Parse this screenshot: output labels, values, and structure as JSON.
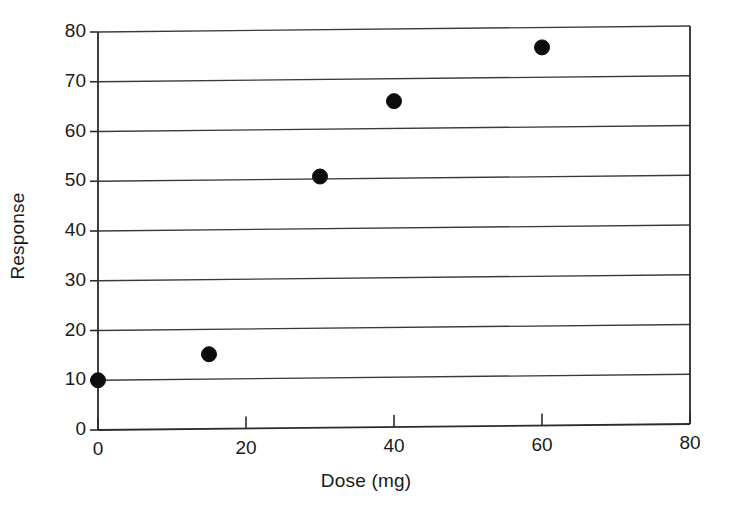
{
  "chart_data": {
    "type": "scatter",
    "title": "",
    "subtitle": "",
    "xlabel": "Dose (mg)",
    "ylabel": "Response",
    "xlim": [
      0,
      80
    ],
    "ylim": [
      0,
      80
    ],
    "xticks": [
      0,
      20,
      40,
      60,
      80
    ],
    "yticks": [
      0,
      10,
      20,
      30,
      40,
      50,
      60,
      70,
      80
    ],
    "xtick_labels": [
      "0",
      "20",
      "40",
      "60",
      "80"
    ],
    "ytick_labels": [
      "0",
      "10",
      "20",
      "30",
      "40",
      "50",
      "60",
      "70",
      "80"
    ],
    "grid": {
      "horizontal": true,
      "vertical": false,
      "interval": 10,
      "color": "#3a3a3a"
    },
    "legend": {
      "visible": false,
      "position": "none",
      "entries": []
    },
    "annotations": [],
    "marker": {
      "shape": "circle",
      "filled": true,
      "color": "#0d0d0d",
      "edge_color": "#0d0d0d",
      "size_px": 15
    },
    "series": [
      {
        "name": "Response vs Dose",
        "color": "#0d0d0d",
        "points": [
          {
            "x": 0,
            "y": 10.0
          },
          {
            "x": 15,
            "y": 15.0
          },
          {
            "x": 30,
            "y": 50.5
          },
          {
            "x": 40,
            "y": 65.5
          },
          {
            "x": 60,
            "y": 76.0
          }
        ],
        "x": [
          0,
          15,
          30,
          40,
          60
        ],
        "values": [
          10.0,
          15.0,
          50.5,
          65.5,
          76.0
        ]
      }
    ],
    "axes_style": {
      "left_spine": true,
      "right_spine": true,
      "top_spine": false,
      "bottom_spine": true,
      "tick_direction": "out",
      "line_color": "#2b2b2b"
    }
  }
}
